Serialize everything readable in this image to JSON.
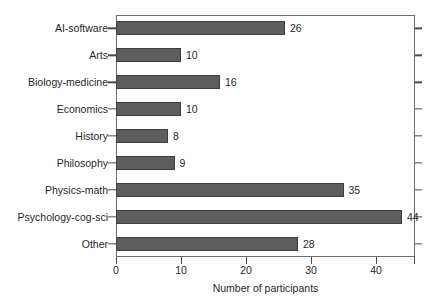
{
  "chart_data": {
    "type": "bar",
    "orientation": "horizontal",
    "title": "",
    "xlabel": "Number of participants",
    "ylabel": "",
    "categories": [
      "AI-software",
      "Arts",
      "Biology-medicine",
      "Economics",
      "History",
      "Philosophy",
      "Physics-math",
      "Psychology-cog-sci",
      "Other"
    ],
    "values": [
      26,
      10,
      16,
      10,
      8,
      9,
      35,
      44,
      28
    ],
    "data_labels": [
      "26",
      "10",
      "16",
      "10",
      "8",
      "9",
      "35",
      "44",
      "28"
    ],
    "xlim": [
      0,
      46
    ],
    "xticks": [
      0,
      10,
      20,
      30,
      40
    ],
    "xtick_labels": [
      "0",
      "10",
      "20",
      "30",
      "40"
    ],
    "grid": false,
    "legend": false,
    "bar_color": "#5d5d5d",
    "bar_edge_color": "#3d3d3d",
    "axes_color": "#6d6d6d",
    "background": "#ffffff",
    "text_color": "#1f1f1f"
  }
}
